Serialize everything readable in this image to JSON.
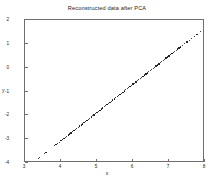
{
  "chart_data": {
    "type": "scatter",
    "title": "Reconstructed data after PCA",
    "xlabel": "x",
    "ylabel": "y",
    "xlim": [
      3,
      8
    ],
    "ylim": [
      -4,
      2
    ],
    "grid": false,
    "legend": null,
    "xticks": [
      3,
      4,
      5,
      6,
      7,
      8
    ],
    "yticks": [
      -4,
      -3,
      -2,
      -1,
      0,
      1,
      2
    ],
    "xticklabels": [
      "3",
      "4",
      "5",
      "6",
      "7",
      "8"
    ],
    "yticklabels": [
      "-4",
      "-3",
      "-2",
      "-1",
      "0",
      "1",
      "2"
    ],
    "marker": "dot",
    "marker_color": "#000000",
    "series": [
      {
        "name": "reconstructed",
        "x": [
          3.38,
          3.41,
          3.55,
          3.58,
          3.82,
          3.86,
          3.9,
          3.95,
          4.0,
          4.04,
          4.08,
          4.12,
          4.16,
          4.2,
          4.24,
          4.28,
          4.32,
          4.36,
          4.4,
          4.44,
          4.48,
          4.52,
          4.56,
          4.6,
          4.64,
          4.68,
          4.72,
          4.76,
          4.8,
          4.84,
          4.88,
          4.92,
          4.96,
          5.0,
          5.04,
          5.08,
          5.12,
          5.16,
          5.2,
          5.24,
          5.28,
          5.32,
          5.36,
          5.4,
          5.44,
          5.48,
          5.52,
          5.56,
          5.6,
          5.64,
          5.68,
          5.72,
          5.76,
          5.8,
          5.84,
          5.88,
          5.92,
          5.96,
          6.0,
          6.04,
          6.08,
          6.12,
          6.16,
          6.2,
          6.24,
          6.28,
          6.32,
          6.36,
          6.4,
          6.44,
          6.48,
          6.52,
          6.56,
          6.6,
          6.64,
          6.68,
          6.72,
          6.76,
          6.8,
          6.84,
          6.88,
          6.92,
          6.96,
          7.0,
          7.04,
          7.08,
          7.12,
          7.16,
          7.2,
          7.24,
          7.28,
          7.32,
          7.38,
          7.44,
          7.5,
          7.56,
          7.62,
          7.7,
          7.78,
          7.88
        ],
        "y": [
          -3.8,
          -3.76,
          -3.6,
          -3.56,
          -3.28,
          -3.23,
          -3.18,
          -3.13,
          -3.07,
          -3.02,
          -2.97,
          -2.93,
          -2.88,
          -2.83,
          -2.78,
          -2.74,
          -2.69,
          -2.64,
          -2.59,
          -2.55,
          -2.5,
          -2.45,
          -2.4,
          -2.36,
          -2.31,
          -2.26,
          -2.21,
          -2.17,
          -2.12,
          -2.07,
          -2.02,
          -1.98,
          -1.93,
          -1.88,
          -1.83,
          -1.79,
          -1.74,
          -1.69,
          -1.64,
          -1.6,
          -1.55,
          -1.5,
          -1.45,
          -1.41,
          -1.36,
          -1.31,
          -1.26,
          -1.22,
          -1.17,
          -1.12,
          -1.07,
          -1.03,
          -0.98,
          -0.93,
          -0.88,
          -0.84,
          -0.79,
          -0.74,
          -0.69,
          -0.65,
          -0.6,
          -0.55,
          -0.5,
          -0.46,
          -0.41,
          -0.36,
          -0.31,
          -0.27,
          -0.22,
          -0.17,
          -0.12,
          -0.08,
          -0.03,
          0.02,
          0.07,
          0.11,
          0.16,
          0.21,
          0.26,
          0.3,
          0.35,
          0.4,
          0.45,
          0.49,
          0.54,
          0.59,
          0.64,
          0.68,
          0.73,
          0.78,
          0.83,
          0.87,
          0.94,
          1.01,
          1.08,
          1.15,
          1.22,
          1.31,
          1.4,
          1.52
        ]
      }
    ]
  }
}
